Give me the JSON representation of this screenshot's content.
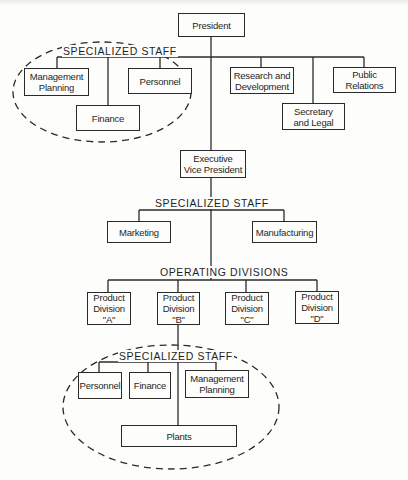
{
  "diagram": {
    "type": "organization-chart",
    "colors": {
      "line": "#2a2a2a",
      "background": "#fdfdfb",
      "text": "#1f1f1f"
    },
    "president": {
      "label": "President"
    },
    "top_specialized_staff": {
      "label": "SPECIALIZED STAFF",
      "items": [
        {
          "label": "Management\nPlanning"
        },
        {
          "label": "Personnel"
        },
        {
          "label": "Finance"
        }
      ]
    },
    "top_staff_offices": [
      {
        "label": "Research and\nDevelopment"
      },
      {
        "label": "Secretary\nand Legal"
      },
      {
        "label": "Public\nRelations"
      }
    ],
    "executive_vp": {
      "label": "Executive\nVice President"
    },
    "evp_specialized_staff": {
      "label": "SPECIALIZED STAFF",
      "items": [
        {
          "label": "Marketing"
        },
        {
          "label": "Manufacturing"
        }
      ]
    },
    "operating_divisions": {
      "label": "OPERATING DIVISIONS",
      "items": [
        {
          "label": "Product\nDivision\n\"A\""
        },
        {
          "label": "Product\nDivision\n\"B\""
        },
        {
          "label": "Product\nDivision\n\"C\""
        },
        {
          "label": "Product\nDivision\n\"D\""
        }
      ]
    },
    "division_specialized_staff": {
      "label": "SPECIALIZED STAFF",
      "items": [
        {
          "label": "Personnel"
        },
        {
          "label": "Finance"
        },
        {
          "label": "Management\nPlanning"
        }
      ]
    },
    "plants": {
      "label": "Plants"
    }
  }
}
